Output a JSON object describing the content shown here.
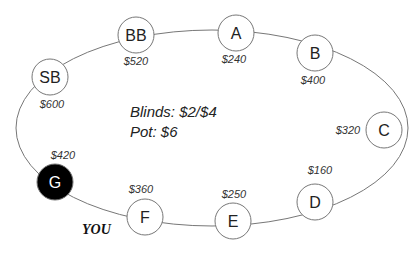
{
  "table": {
    "blinds": "Blinds: $2/$4",
    "pot": "Pot: $6",
    "you_label": "YOU"
  },
  "seats": [
    {
      "id": "SB",
      "label": "SB",
      "stack": "$600",
      "cx": 50,
      "cy": 77,
      "sx": 52,
      "sy": 108,
      "anchor": "middle",
      "filled": false
    },
    {
      "id": "BB",
      "label": "BB",
      "stack": "$520",
      "cx": 136,
      "cy": 35,
      "sx": 136,
      "sy": 65,
      "anchor": "middle",
      "filled": false
    },
    {
      "id": "A",
      "label": "A",
      "stack": "$240",
      "cx": 236,
      "cy": 33,
      "sx": 234,
      "sy": 63,
      "anchor": "middle",
      "filled": false
    },
    {
      "id": "B",
      "label": "B",
      "stack": "$400",
      "cx": 315,
      "cy": 53,
      "sx": 313,
      "sy": 84,
      "anchor": "middle",
      "filled": false
    },
    {
      "id": "C",
      "label": "C",
      "stack": "$320",
      "cx": 384,
      "cy": 130,
      "sx": 348,
      "sy": 134,
      "anchor": "middle",
      "filled": false
    },
    {
      "id": "D",
      "label": "D",
      "stack": "$160",
      "cx": 315,
      "cy": 202,
      "sx": 320,
      "sy": 174,
      "anchor": "middle",
      "filled": false
    },
    {
      "id": "E",
      "label": "E",
      "stack": "$250",
      "cx": 233,
      "cy": 221,
      "sx": 234,
      "sy": 198,
      "anchor": "middle",
      "filled": false
    },
    {
      "id": "F",
      "label": "F",
      "stack": "$360",
      "cx": 145,
      "cy": 217,
      "sx": 141,
      "sy": 193,
      "anchor": "middle",
      "filled": false
    },
    {
      "id": "G",
      "label": "G",
      "stack": "$420",
      "cx": 55,
      "cy": 182,
      "sx": 63,
      "sy": 159,
      "anchor": "middle",
      "filled": true
    }
  ],
  "colors": {
    "ring": "#777777",
    "seat_stroke": "#777777",
    "seat_fill": "#ffffff",
    "hero_fill": "#000000",
    "hero_text": "#ffffff"
  }
}
